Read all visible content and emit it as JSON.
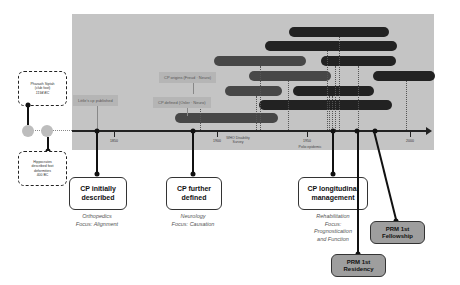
{
  "timeline": {
    "axis_ticks": [
      {
        "label": "1850",
        "x": 114
      },
      {
        "label": "1900",
        "x": 217
      },
      {
        "label": "1950",
        "x": 307
      },
      {
        "label": "2000",
        "x": 410
      }
    ],
    "axis_annotations": [
      {
        "id": "who",
        "text": "WHO Disability Survey",
        "x": 238
      },
      {
        "id": "polio",
        "text": "Polio epidemic",
        "x": 307
      }
    ],
    "gray_labels": [
      {
        "id": "littles",
        "text": "Little's cp published"
      },
      {
        "id": "cp-origins",
        "text": "CP origins (Freud · Neuro)"
      },
      {
        "id": "cp-defined",
        "text": "CP defined (Osler · Neuro)"
      }
    ],
    "ancient_events": [
      {
        "id": "pharaoh",
        "lines": [
          "Pharaoh Siptah",
          "(club foot)",
          "1194 BC"
        ]
      },
      {
        "id": "hippocrates",
        "lines": [
          "Hippocrates",
          "described foot",
          "deformities",
          "400 BC"
        ]
      }
    ]
  },
  "milestones": [
    {
      "id": "initially",
      "title_lines": [
        "CP initially",
        "described"
      ],
      "focus_lines": [
        "Orthopedics",
        "Focus: Alignment"
      ]
    },
    {
      "id": "further",
      "title_lines": [
        "CP further",
        "defined"
      ],
      "focus_lines": [
        "Neurology",
        "Focus: Causation"
      ]
    },
    {
      "id": "longitudinal",
      "title_lines": [
        "CP longitudinal",
        "management"
      ],
      "focus_lines": [
        "Rehabilitation",
        "Focus:",
        "Prognostication",
        "and Function"
      ]
    }
  ],
  "prm_events": [
    {
      "id": "residency",
      "title_lines": [
        "PRM 1st",
        "Residency"
      ]
    },
    {
      "id": "fellowship",
      "title_lines": [
        "PRM 1st",
        "Fellowship"
      ]
    }
  ],
  "colors": {
    "panel": "#c4c4c4",
    "bar_dark": "#222222",
    "bar_mid": "#474747",
    "prm_box": "#9e9e9e"
  }
}
